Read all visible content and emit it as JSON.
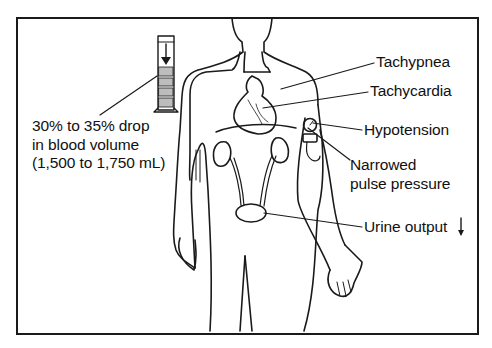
{
  "figure": {
    "stroke_color": "#1a1a1a",
    "background": "#ffffff"
  },
  "left_callout": {
    "icon": "graduated-cylinder-icon",
    "lines": [
      "30% to 35% drop",
      "in blood volume",
      "(1,500 to 1,750 mL)"
    ]
  },
  "labels": [
    {
      "id": "tachypnea",
      "text": "Tachypnea",
      "points_to": "lungs"
    },
    {
      "id": "tachycardia",
      "text": "Tachycardia",
      "points_to": "heart"
    },
    {
      "id": "hypotension",
      "text": "Hypotension",
      "points_to": "blood-pressure-cuff-gauge"
    },
    {
      "id": "narrowed",
      "text": "Narrowed",
      "points_to": "blood-pressure-cuff"
    },
    {
      "id": "pulse_pressure",
      "text": "pulse pressure",
      "points_to": "blood-pressure-cuff"
    },
    {
      "id": "urine_output",
      "text": "Urine output",
      "points_to": "bladder",
      "suffix_icon": "down-arrow-icon"
    }
  ]
}
